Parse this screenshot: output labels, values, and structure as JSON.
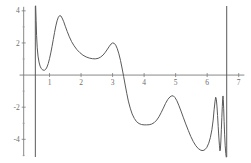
{
  "chart_data": {
    "type": "line",
    "title": "",
    "subtitle": "",
    "xlabel": "",
    "ylabel": "",
    "xlim": [
      0.0,
      7.2
    ],
    "ylim": [
      -5.1,
      4.3
    ],
    "grid": false,
    "legend": null,
    "x_ticks": [
      1,
      2,
      3,
      4,
      5,
      6,
      7
    ],
    "x_tick_labels": [
      "1",
      "2",
      "3",
      "4",
      "5",
      "6",
      "7"
    ],
    "y_ticks": [
      -4,
      -2,
      2,
      4
    ],
    "y_tick_labels": [
      "-4",
      "-2",
      "2",
      "4"
    ],
    "y_minor_ticks": [
      -5,
      -3,
      -1,
      1,
      3
    ],
    "axis_color": "#7a7a7a",
    "curve_color": "#5a5a5a",
    "background_color": "#ffffff",
    "asymptotes": [
      0.55,
      6.62
    ],
    "series": [
      {
        "name": "f(x)",
        "points": [
          [
            0.56,
            4.3
          ],
          [
            0.575,
            3.4
          ],
          [
            0.59,
            2.45
          ],
          [
            0.61,
            1.7
          ],
          [
            0.635,
            1.18
          ],
          [
            0.665,
            0.82
          ],
          [
            0.7,
            0.56
          ],
          [
            0.74,
            0.4
          ],
          [
            0.79,
            0.31
          ],
          [
            0.84,
            0.3
          ],
          [
            0.88,
            0.36
          ],
          [
            0.92,
            0.5
          ],
          [
            0.96,
            0.72
          ],
          [
            1.0,
            1.02
          ],
          [
            1.04,
            1.38
          ],
          [
            1.08,
            1.79
          ],
          [
            1.12,
            2.22
          ],
          [
            1.16,
            2.66
          ],
          [
            1.2,
            3.06
          ],
          [
            1.24,
            3.38
          ],
          [
            1.28,
            3.6
          ],
          [
            1.32,
            3.7
          ],
          [
            1.36,
            3.68
          ],
          [
            1.4,
            3.55
          ],
          [
            1.45,
            3.32
          ],
          [
            1.5,
            3.04
          ],
          [
            1.56,
            2.72
          ],
          [
            1.62,
            2.42
          ],
          [
            1.7,
            2.08
          ],
          [
            1.78,
            1.82
          ],
          [
            1.87,
            1.58
          ],
          [
            1.96,
            1.4
          ],
          [
            2.06,
            1.24
          ],
          [
            2.16,
            1.13
          ],
          [
            2.26,
            1.06
          ],
          [
            2.36,
            1.02
          ],
          [
            2.45,
            1.01
          ],
          [
            2.54,
            1.04
          ],
          [
            2.62,
            1.12
          ],
          [
            2.7,
            1.25
          ],
          [
            2.77,
            1.42
          ],
          [
            2.84,
            1.62
          ],
          [
            2.9,
            1.8
          ],
          [
            2.95,
            1.93
          ],
          [
            3.0,
            2.0
          ],
          [
            3.05,
            1.98
          ],
          [
            3.1,
            1.86
          ],
          [
            3.15,
            1.64
          ],
          [
            3.2,
            1.32
          ],
          [
            3.25,
            0.92
          ],
          [
            3.3,
            0.44
          ],
          [
            3.35,
            -0.08
          ],
          [
            3.4,
            -0.62
          ],
          [
            3.45,
            -1.14
          ],
          [
            3.5,
            -1.62
          ],
          [
            3.56,
            -2.06
          ],
          [
            3.62,
            -2.42
          ],
          [
            3.69,
            -2.7
          ],
          [
            3.76,
            -2.9
          ],
          [
            3.84,
            -3.02
          ],
          [
            3.92,
            -3.08
          ],
          [
            4.0,
            -3.1
          ],
          [
            4.08,
            -3.1
          ],
          [
            4.16,
            -3.09
          ],
          [
            4.24,
            -3.05
          ],
          [
            4.32,
            -2.96
          ],
          [
            4.4,
            -2.8
          ],
          [
            4.47,
            -2.6
          ],
          [
            4.54,
            -2.34
          ],
          [
            4.61,
            -2.06
          ],
          [
            4.68,
            -1.76
          ],
          [
            4.75,
            -1.52
          ],
          [
            4.82,
            -1.36
          ],
          [
            4.88,
            -1.29
          ],
          [
            4.93,
            -1.3
          ],
          [
            4.98,
            -1.4
          ],
          [
            5.04,
            -1.6
          ],
          [
            5.1,
            -1.88
          ],
          [
            5.17,
            -2.24
          ],
          [
            5.24,
            -2.62
          ],
          [
            5.32,
            -3.04
          ],
          [
            5.4,
            -3.44
          ],
          [
            5.48,
            -3.82
          ],
          [
            5.56,
            -4.14
          ],
          [
            5.64,
            -4.4
          ],
          [
            5.72,
            -4.58
          ],
          [
            5.8,
            -4.68
          ],
          [
            5.87,
            -4.7
          ],
          [
            5.93,
            -4.64
          ],
          [
            5.99,
            -4.5
          ],
          [
            6.05,
            -4.24
          ],
          [
            6.1,
            -3.9
          ],
          [
            6.15,
            -3.4
          ],
          [
            6.19,
            -2.8
          ],
          [
            6.22,
            -2.16
          ],
          [
            6.25,
            -1.62
          ],
          [
            6.27,
            -1.38
          ],
          [
            6.29,
            -1.5
          ],
          [
            6.31,
            -1.92
          ],
          [
            6.33,
            -2.52
          ],
          [
            6.35,
            -3.2
          ],
          [
            6.37,
            -3.86
          ],
          [
            6.39,
            -4.4
          ],
          [
            6.405,
            -4.72
          ],
          [
            6.42,
            -4.6
          ],
          [
            6.435,
            -4.1
          ],
          [
            6.45,
            -3.4
          ],
          [
            6.465,
            -2.64
          ],
          [
            6.48,
            -1.96
          ],
          [
            6.492,
            -1.48
          ],
          [
            6.502,
            -1.3
          ],
          [
            6.512,
            -1.52
          ],
          [
            6.524,
            -2.1
          ],
          [
            6.538,
            -2.9
          ],
          [
            6.554,
            -3.72
          ],
          [
            6.572,
            -4.4
          ],
          [
            6.59,
            -4.88
          ],
          [
            6.605,
            -5.1
          ]
        ]
      }
    ],
    "asymptote_segments": [
      {
        "x": 0.55,
        "y_from": 4.3,
        "y_to": -5.1
      },
      {
        "x": 6.62,
        "y_from": 4.3,
        "y_to": -5.1
      }
    ]
  }
}
